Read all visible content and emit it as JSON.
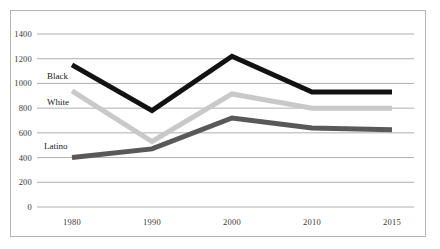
{
  "chart_data": {
    "type": "line",
    "title": "",
    "subtitle": "",
    "xlabel": "",
    "ylabel": "",
    "categories": [
      "1980",
      "1990",
      "2000",
      "2010",
      "2015"
    ],
    "x": [
      1980,
      1990,
      2000,
      2010,
      2015
    ],
    "ylim": [
      0,
      1400
    ],
    "ytick_labels": [
      "0",
      "200",
      "400",
      "600",
      "800",
      "1000",
      "1200",
      "1400"
    ],
    "yticks": [
      0,
      200,
      400,
      600,
      800,
      1000,
      1200,
      1400
    ],
    "grid": true,
    "legend_position": "inline-labels-left",
    "series": [
      {
        "name": "Black",
        "color": "#121212",
        "values": [
          1150,
          780,
          1220,
          930,
          930
        ]
      },
      {
        "name": "White",
        "color": "#c9c9c9",
        "values": [
          940,
          530,
          915,
          800,
          800
        ]
      },
      {
        "name": "Latino",
        "color": "#595959",
        "values": [
          400,
          470,
          720,
          640,
          625
        ]
      }
    ],
    "annotations": [
      {
        "text": "Black",
        "near_x": 1980,
        "near_y": 1030
      },
      {
        "text": "White",
        "near_x": 1980,
        "near_y": 835
      },
      {
        "text": "Latino",
        "near_x": 1980,
        "near_y": 475
      }
    ]
  },
  "colors": {
    "frame_border": "#b5b5b5",
    "gridline": "#9b9b9b",
    "axis_text": "#3a3a3a",
    "background": "#ffffff",
    "series_black": "#121212",
    "series_white": "#c9c9c9",
    "series_latino": "#595959"
  }
}
